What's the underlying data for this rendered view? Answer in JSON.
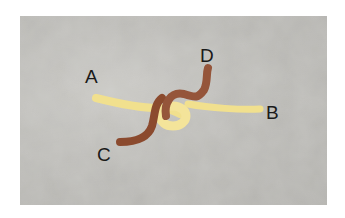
{
  "figure": {
    "labels": {
      "a": "A",
      "b": "B",
      "c": "C",
      "d": "D"
    },
    "colors": {
      "background": "#bebdb9",
      "yellow_strand": "#f1e08e",
      "brown_strand": "#8b4a2e",
      "label": "#1a1a1a"
    }
  }
}
